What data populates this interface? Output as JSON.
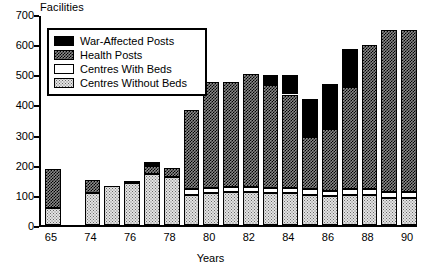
{
  "chart_data": {
    "type": "bar",
    "title": "",
    "ylabel": "Facilities",
    "xlabel": "Years",
    "ylim": [
      0,
      700
    ],
    "yticks": [
      0,
      100,
      200,
      300,
      400,
      500,
      600,
      700
    ],
    "grid": false,
    "legend_position": "top-left",
    "stacked": true,
    "categories": [
      "65",
      "74",
      "75",
      "76",
      "77",
      "78",
      "79",
      "80",
      "81",
      "82",
      "83",
      "84",
      "85",
      "86",
      "87",
      "88",
      "89",
      "90"
    ],
    "tick_labels": [
      "65",
      "74",
      "76",
      "78",
      "80",
      "82",
      "84",
      "86",
      "88",
      "90"
    ],
    "series": [
      {
        "name": "Centres Without Beds",
        "values": [
          55,
          105,
          130,
          140,
          170,
          160,
          100,
          105,
          110,
          110,
          105,
          105,
          100,
          95,
          100,
          100,
          90,
          90
        ]
      },
      {
        "name": "Centres With Beds",
        "values": [
          0,
          0,
          0,
          0,
          0,
          0,
          18,
          18,
          15,
          15,
          18,
          18,
          18,
          18,
          18,
          18,
          18,
          18
        ]
      },
      {
        "name": "Health Posts",
        "values": [
          130,
          45,
          0,
          5,
          25,
          30,
          265,
          350,
          350,
          375,
          340,
          310,
          175,
          205,
          340,
          480,
          540,
          540
        ]
      },
      {
        "name": "War-Affected Posts",
        "values": [
          0,
          0,
          0,
          0,
          15,
          0,
          0,
          0,
          0,
          0,
          35,
          65,
          125,
          150,
          125,
          0,
          0,
          0
        ]
      }
    ],
    "legend": [
      {
        "label": "War-Affected Posts",
        "fill": "solid-black"
      },
      {
        "label": "Health Posts",
        "fill": "cross-hatch"
      },
      {
        "label": "Centres With Beds",
        "fill": "white"
      },
      {
        "label": "Centres Without Beds",
        "fill": "stipple"
      }
    ]
  },
  "colors": {
    "axis": "#000000",
    "war": "#000000",
    "health": "#8b8b8b",
    "withbeds": "#ffffff",
    "nobeds": "#e3e3e3"
  }
}
